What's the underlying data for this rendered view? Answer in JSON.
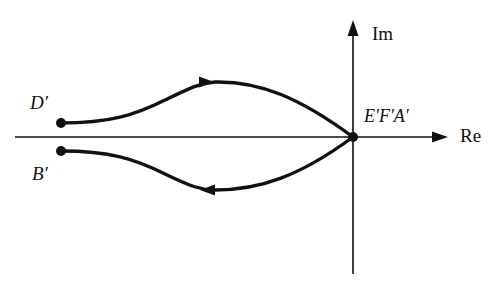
{
  "diagram": {
    "type": "nyquist-plot-contour-map",
    "axes": {
      "real_label": "Re",
      "imag_label": "Im",
      "origin_px": [
        353,
        137
      ]
    },
    "points": {
      "D": {
        "label": "D′",
        "px": [
          61,
          123
        ]
      },
      "B": {
        "label": "B′",
        "px": [
          61,
          151
        ]
      },
      "origin": {
        "label": "E′F′A′",
        "px": [
          353,
          137
        ]
      }
    },
    "paths": [
      {
        "name": "upper-branch",
        "from": "D′",
        "to": "E′F′A′",
        "direction": "right"
      },
      {
        "name": "lower-branch",
        "from": "E′F′A′",
        "to": "B′",
        "direction": "left"
      }
    ],
    "colors": {
      "stroke": "#111111",
      "background": "#ffffff"
    }
  }
}
